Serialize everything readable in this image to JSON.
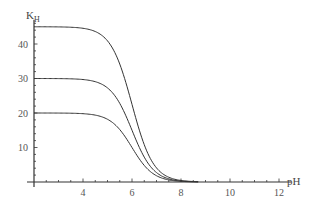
{
  "chart_data": {
    "type": "line",
    "title": "",
    "xlabel": "pH",
    "ylabel": "K_H",
    "ylabel_main": "K",
    "ylabel_sub": "H",
    "xlim": [
      2,
      12.5
    ],
    "ylim": [
      0,
      47
    ],
    "grid": false,
    "legend": null,
    "x_ticks": [
      4,
      6,
      8,
      10,
      12
    ],
    "x_tick_labels": [
      "4",
      "6",
      "8",
      "10",
      "12"
    ],
    "y_ticks": [
      10,
      20,
      30,
      40
    ],
    "y_tick_labels": [
      "10",
      "20",
      "30",
      "40"
    ],
    "model": "K = Kmax / (1 + 10^(pH - pKa))",
    "series": [
      {
        "name": "Kmax=45",
        "kmax": 45,
        "pka": 6.0,
        "x": [
          2,
          3,
          4,
          4.5,
          5,
          5.5,
          6,
          6.5,
          7,
          7.5,
          8,
          9,
          10,
          12
        ],
        "y": [
          45,
          45,
          44.6,
          43.6,
          40.9,
          34.2,
          22.5,
          10.8,
          4.1,
          1.4,
          0.4,
          0.05,
          0,
          0
        ]
      },
      {
        "name": "Kmax=30",
        "kmax": 30,
        "pka": 6.0,
        "x": [
          2,
          3,
          4,
          4.5,
          5,
          5.5,
          6,
          6.5,
          7,
          7.5,
          8,
          9,
          10,
          12
        ],
        "y": [
          30,
          30,
          29.7,
          29.1,
          27.3,
          22.8,
          15.0,
          7.2,
          2.7,
          0.9,
          0.3,
          0.03,
          0,
          0
        ]
      },
      {
        "name": "Kmax=20",
        "kmax": 20,
        "pka": 6.0,
        "x": [
          2,
          3,
          4,
          4.5,
          5,
          5.5,
          6,
          6.5,
          7,
          7.5,
          8,
          9,
          10,
          12
        ],
        "y": [
          20,
          20,
          19.8,
          19.4,
          18.2,
          15.2,
          10.0,
          4.8,
          1.8,
          0.6,
          0.2,
          0.02,
          0,
          0
        ]
      }
    ]
  },
  "colors": {
    "axis": "#333333",
    "curve": "#333333",
    "background": "#ffffff"
  }
}
